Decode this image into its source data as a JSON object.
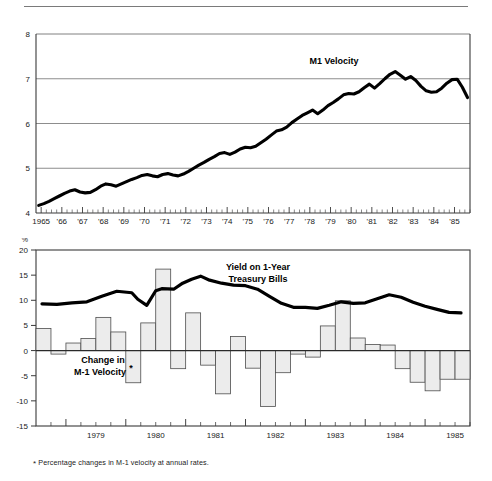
{
  "figure": {
    "footnote_marker": "*",
    "footnote_text": "Percentage changes in M-1 velocity at annual rates.",
    "panel_top_label": "M1 Velocity",
    "panel_bottom_label_line1": "Yield on 1-Year",
    "panel_bottom_label_line2": "Treasury Bills",
    "panel_bottom_bars_label_line1": "Change in",
    "panel_bottom_bars_label_line2": "M-1 Velocity",
    "percent_unit": "%",
    "colors": {
      "line": "#000000",
      "grid": "#808080",
      "axis": "#4d4d4d",
      "bar_fill": "#ececec",
      "bar_stroke": "#4d4d4d",
      "text": "#1a1a1a"
    }
  },
  "chart_data": [
    {
      "type": "line",
      "title": "M1 Velocity",
      "xlabel": "",
      "ylabel": "",
      "ylim": [
        4,
        8
      ],
      "yticks": [
        4,
        5,
        6,
        7,
        8
      ],
      "ytick_labels": [
        "4",
        "5",
        "6",
        "7",
        "8"
      ],
      "grid": true,
      "legend": "inline-annotation",
      "xlim": [
        1964.75,
        1985.75
      ],
      "xtick_labels": [
        "1965",
        "'66",
        "'67",
        "'68",
        "'69",
        "'70",
        "'71",
        "'72",
        "'73",
        "'74",
        "'75",
        "'76",
        "'77",
        "'78",
        "'79",
        "'80",
        "'81",
        "'82",
        "'83",
        "'84",
        "'85"
      ],
      "xticks": [
        1965,
        1966,
        1967,
        1968,
        1969,
        1970,
        1971,
        1972,
        1973,
        1974,
        1975,
        1976,
        1977,
        1978,
        1979,
        1980,
        1981,
        1982,
        1983,
        1984,
        1985
      ],
      "minor_ticks_per_year": 4,
      "series": [
        {
          "name": "M1 Velocity",
          "x": [
            1964.88,
            1965.13,
            1965.38,
            1965.63,
            1965.88,
            1966.13,
            1966.38,
            1966.63,
            1966.88,
            1967.13,
            1967.38,
            1967.63,
            1967.88,
            1968.13,
            1968.38,
            1968.63,
            1968.88,
            1969.13,
            1969.38,
            1969.63,
            1969.88,
            1970.13,
            1970.38,
            1970.63,
            1970.88,
            1971.13,
            1971.38,
            1971.63,
            1971.88,
            1972.13,
            1972.38,
            1972.63,
            1972.88,
            1973.13,
            1973.38,
            1973.63,
            1973.88,
            1974.13,
            1974.38,
            1974.63,
            1974.88,
            1975.13,
            1975.38,
            1975.63,
            1975.88,
            1976.13,
            1976.38,
            1976.63,
            1976.88,
            1977.13,
            1977.38,
            1977.63,
            1977.88,
            1978.13,
            1978.38,
            1978.63,
            1978.88,
            1979.13,
            1979.38,
            1979.63,
            1979.88,
            1980.13,
            1980.38,
            1980.63,
            1980.88,
            1981.13,
            1981.38,
            1981.63,
            1981.88,
            1982.13,
            1982.38,
            1982.63,
            1982.88,
            1983.13,
            1983.38,
            1983.63,
            1983.88,
            1984.13,
            1984.38,
            1984.63,
            1984.88,
            1985.13,
            1985.38,
            1985.63
          ],
          "y": [
            4.17,
            4.21,
            4.26,
            4.32,
            4.38,
            4.44,
            4.49,
            4.52,
            4.47,
            4.45,
            4.46,
            4.52,
            4.6,
            4.65,
            4.63,
            4.6,
            4.65,
            4.7,
            4.75,
            4.79,
            4.84,
            4.86,
            4.83,
            4.81,
            4.86,
            4.88,
            4.85,
            4.83,
            4.87,
            4.93,
            5.0,
            5.07,
            5.13,
            5.2,
            5.26,
            5.33,
            5.35,
            5.31,
            5.36,
            5.43,
            5.47,
            5.46,
            5.49,
            5.57,
            5.65,
            5.74,
            5.83,
            5.86,
            5.92,
            6.02,
            6.1,
            6.18,
            6.24,
            6.3,
            6.22,
            6.3,
            6.4,
            6.47,
            6.55,
            6.64,
            6.67,
            6.66,
            6.71,
            6.8,
            6.88,
            6.79,
            6.89,
            7.0,
            7.1,
            7.16,
            7.08,
            6.99,
            7.05,
            6.96,
            6.83,
            6.73,
            6.7,
            6.71,
            6.79,
            6.9,
            6.98,
            6.99,
            6.81,
            6.58
          ]
        }
      ]
    },
    {
      "type": "bar+line",
      "title": "",
      "xlabel": "",
      "ylabel": "%",
      "ylim": [
        -15,
        20
      ],
      "yticks": [
        -15,
        -10,
        -5,
        0,
        5,
        10,
        15,
        20
      ],
      "ytick_labels": [
        "-15",
        "-10",
        "-5",
        "0",
        "5",
        "10",
        "15",
        "20"
      ],
      "grid": false,
      "xlim": [
        1978.5,
        1985.75
      ],
      "xticks": [
        1979,
        1980,
        1981,
        1982,
        1983,
        1984,
        1985
      ],
      "xtick_labels": [
        "1979",
        "1980",
        "1981",
        "1982",
        "1983",
        "1984",
        "1985"
      ],
      "bars": {
        "name": "Change in M-1 Velocity",
        "unit": "%",
        "quarters": [
          "1978Q4",
          "1979Q1",
          "1979Q2",
          "1979Q3",
          "1979Q4",
          "1980Q1",
          "1980Q2",
          "1980Q3",
          "1980Q4",
          "1981Q1",
          "1981Q2",
          "1981Q3",
          "1981Q4",
          "1982Q1",
          "1982Q2",
          "1982Q3",
          "1982Q4",
          "1983Q1",
          "1983Q2",
          "1983Q3",
          "1983Q4",
          "1984Q1",
          "1984Q2",
          "1984Q3",
          "1984Q4",
          "1985Q1",
          "1985Q2",
          "1985Q3",
          "1985Q4"
        ],
        "values": [
          4.4,
          -0.7,
          1.5,
          2.4,
          6.6,
          3.7,
          -6.4,
          5.5,
          16.2,
          -3.6,
          7.5,
          -2.9,
          -8.6,
          2.8,
          -3.5,
          -11.1,
          -4.4,
          -0.7,
          -1.3,
          4.9,
          9.9,
          2.5,
          1.2,
          1.1,
          -3.6,
          -6.3,
          -8.0,
          -5.7,
          -5.7
        ]
      },
      "line": {
        "name": "Yield on 1-Year Treasury Bills",
        "unit": "%",
        "x": [
          1978.6,
          1978.85,
          1979.1,
          1979.35,
          1979.6,
          1979.85,
          1980.1,
          1980.2,
          1980.35,
          1980.5,
          1980.6,
          1980.8,
          1980.95,
          1981.1,
          1981.25,
          1981.4,
          1981.6,
          1981.8,
          1982.0,
          1982.2,
          1982.4,
          1982.6,
          1982.8,
          1983.0,
          1983.2,
          1983.4,
          1983.6,
          1983.8,
          1984.0,
          1984.2,
          1984.4,
          1984.6,
          1984.8,
          1985.0,
          1985.2,
          1985.4,
          1985.6
        ],
        "y": [
          9.3,
          9.2,
          9.5,
          9.7,
          10.8,
          11.8,
          11.5,
          10.2,
          9.0,
          11.9,
          12.3,
          12.2,
          13.4,
          14.2,
          14.8,
          14.0,
          13.4,
          13.0,
          12.9,
          12.2,
          10.8,
          9.4,
          8.6,
          8.6,
          8.4,
          9.0,
          9.7,
          9.4,
          9.5,
          10.3,
          11.1,
          10.6,
          9.6,
          8.8,
          8.2,
          7.6,
          7.5
        ]
      }
    }
  ]
}
